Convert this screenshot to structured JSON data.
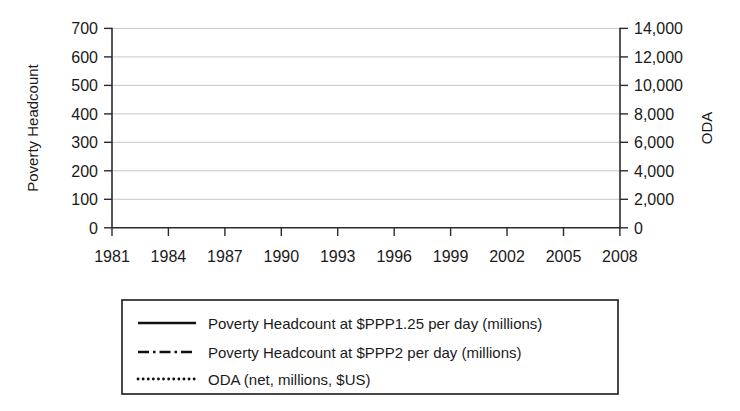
{
  "chart_data": {
    "type": "line",
    "title": "",
    "xlabel": "",
    "ylabel": "Poverty Headcount",
    "y2label": "ODA",
    "grid": true,
    "legend_position": "bottom",
    "xlim": [
      1981,
      2009
    ],
    "ylim": [
      0,
      700
    ],
    "y2lim": [
      0,
      14000
    ],
    "x_tick_labels": [
      "1981",
      "1984",
      "1987",
      "1990",
      "1993",
      "1996",
      "1999",
      "2002",
      "2005",
      "2008"
    ],
    "x_ticks": [
      1981,
      1984,
      1987,
      1990,
      1993,
      1996,
      1999,
      2002,
      2005,
      2008
    ],
    "y_tick_labels": [
      "0",
      "100",
      "200",
      "300",
      "400",
      "500",
      "600",
      "700"
    ],
    "y_ticks": [
      0,
      100,
      200,
      300,
      400,
      500,
      600,
      700
    ],
    "y2_tick_labels": [
      "0",
      "2,000",
      "4,000",
      "6,000",
      "8,000",
      "10,000",
      "12,000",
      "14,000"
    ],
    "y2_ticks": [
      0,
      2000,
      4000,
      6000,
      8000,
      10000,
      12000,
      14000
    ],
    "series": [
      {
        "name": "Poverty Headcount at $PPP1.25 per day (millions)",
        "style": "solid",
        "axis": "left",
        "x": [
          1981,
          1984,
          1987,
          1990,
          1993,
          1996,
          1999,
          2002,
          2005,
          2008
        ],
        "values": [
          565,
          570,
          595,
          618,
          628,
          628,
          618,
          645,
          598,
          572
        ]
      },
      {
        "name": "Poverty Headcount at $PPP2 per day (millions)",
        "style": "dash-dot",
        "axis": "left",
        "x": [
          1981,
          1984,
          1987,
          1990,
          1993,
          1996,
          1999,
          2002,
          2005,
          2008
        ],
        "values": [
          292,
          320,
          345,
          375,
          405,
          432,
          462,
          498,
          538,
          570
        ]
      },
      {
        "name": "ODA (net, millions, $US)",
        "style": "dotted",
        "axis": "right",
        "x": [
          1981,
          1984,
          1987,
          1990,
          1993,
          1996,
          1999,
          2002,
          2005,
          2008
        ],
        "values": [
          4500,
          4320,
          5120,
          6010,
          5400,
          5340,
          5260,
          4180,
          8400,
          12800
        ]
      }
    ]
  },
  "axes": {
    "left_title": "Poverty Headcount",
    "right_title": "ODA"
  },
  "legend": {
    "entries": [
      {
        "label": "Poverty Headcount at $PPP1.25 per day (millions)",
        "style": "solid"
      },
      {
        "label": "Poverty Headcount at $PPP2 per day (millions)",
        "style": "dash-dot"
      },
      {
        "label": "ODA (net, millions, $US)",
        "style": "dotted"
      }
    ]
  }
}
